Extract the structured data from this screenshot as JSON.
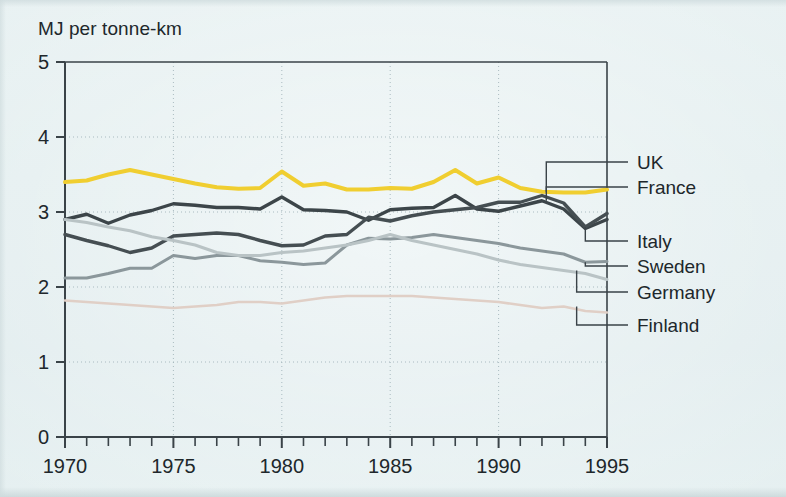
{
  "figure": {
    "y_axis_title": "MJ per tonne-km",
    "background_color": "#e3eef0",
    "axis_color": "#3a4348",
    "grid_color": "#9fb2b8"
  },
  "chart_data": {
    "type": "line",
    "title": "",
    "subtitle": "",
    "xlabel": "",
    "ylabel": "MJ per tonne-km",
    "xlim": [
      1970,
      1995
    ],
    "ylim": [
      0,
      5
    ],
    "xticks": [
      1970,
      1975,
      1980,
      1985,
      1990,
      1995
    ],
    "xtick_labels": [
      "1970",
      "1975",
      "1980",
      "1985",
      "1990",
      "1995"
    ],
    "yticks": [
      0,
      1,
      2,
      3,
      4,
      5
    ],
    "ytick_labels": [
      "0",
      "1",
      "2",
      "3",
      "4",
      "5"
    ],
    "minor_xticks_every": 1,
    "grid": "dotted-both",
    "legend_position": "right-leader-lines",
    "x": [
      1970,
      1971,
      1972,
      1973,
      1974,
      1975,
      1976,
      1977,
      1978,
      1979,
      1980,
      1981,
      1982,
      1983,
      1984,
      1985,
      1986,
      1987,
      1988,
      1989,
      1990,
      1991,
      1992,
      1993,
      1994,
      1995
    ],
    "series": [
      {
        "name": "UK",
        "color": "#f0ce30",
        "width": 4.0,
        "values": [
          3.4,
          3.42,
          3.5,
          3.56,
          3.5,
          3.44,
          3.38,
          3.33,
          3.31,
          3.32,
          3.54,
          3.35,
          3.38,
          3.3,
          3.3,
          3.32,
          3.31,
          3.4,
          3.56,
          3.38,
          3.46,
          3.32,
          3.27,
          3.26,
          3.26,
          3.3
        ]
      },
      {
        "name": "France",
        "color": "#3c4549",
        "width": 3.4,
        "values": [
          2.9,
          2.97,
          2.85,
          2.96,
          3.02,
          3.11,
          3.09,
          3.06,
          3.06,
          3.04,
          3.2,
          3.03,
          3.02,
          3.0,
          2.89,
          3.03,
          3.05,
          3.06,
          3.22,
          3.04,
          3.01,
          3.08,
          3.15,
          3.04,
          2.78,
          2.9
        ]
      },
      {
        "name": "Italy",
        "color": "#454e52",
        "width": 3.4,
        "values": [
          2.7,
          2.62,
          2.55,
          2.46,
          2.52,
          2.68,
          2.7,
          2.72,
          2.7,
          2.62,
          2.55,
          2.56,
          2.68,
          2.7,
          2.93,
          2.88,
          2.95,
          3.0,
          3.03,
          3.06,
          3.13,
          3.13,
          3.22,
          3.12,
          2.8,
          2.98
        ]
      },
      {
        "name": "Sweden",
        "color": "#8b979b",
        "width": 3.0,
        "values": [
          2.12,
          2.12,
          2.18,
          2.25,
          2.25,
          2.42,
          2.38,
          2.42,
          2.42,
          2.35,
          2.33,
          2.3,
          2.32,
          2.56,
          2.65,
          2.64,
          2.66,
          2.7,
          2.66,
          2.62,
          2.58,
          2.52,
          2.48,
          2.44,
          2.33,
          2.34
        ]
      },
      {
        "name": "Germany",
        "color": "#b9c3c5",
        "width": 3.0,
        "values": [
          2.9,
          2.86,
          2.8,
          2.75,
          2.67,
          2.62,
          2.56,
          2.46,
          2.42,
          2.42,
          2.46,
          2.48,
          2.52,
          2.56,
          2.62,
          2.7,
          2.62,
          2.56,
          2.5,
          2.44,
          2.36,
          2.3,
          2.26,
          2.22,
          2.18,
          2.1
        ]
      },
      {
        "name": "Finland",
        "color": "#e0cfc6",
        "width": 2.6,
        "values": [
          1.82,
          1.8,
          1.78,
          1.76,
          1.74,
          1.72,
          1.74,
          1.76,
          1.8,
          1.8,
          1.78,
          1.82,
          1.86,
          1.88,
          1.88,
          1.88,
          1.88,
          1.86,
          1.84,
          1.82,
          1.8,
          1.76,
          1.72,
          1.74,
          1.68,
          1.66
        ]
      }
    ],
    "legend_entries": [
      {
        "label": "UK",
        "color": "#f0ce30"
      },
      {
        "label": "France",
        "color": "#3c4549"
      },
      {
        "label": "Italy",
        "color": "#454e52"
      },
      {
        "label": "Sweden",
        "color": "#8b979b"
      },
      {
        "label": "Germany",
        "color": "#b9c3c5"
      },
      {
        "label": "Finland",
        "color": "#e0cfc6"
      }
    ]
  }
}
